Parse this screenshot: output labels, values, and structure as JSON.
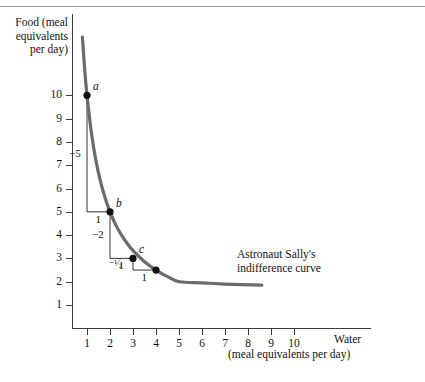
{
  "chart_data": {
    "type": "line",
    "title": "",
    "xlabel": "Water",
    "xlabel_unit": "(meal equivalents per day)",
    "ylabel_lines": [
      "Food (meal",
      "equivalents",
      "per day)"
    ],
    "xlim": [
      0,
      11.5
    ],
    "ylim": [
      0,
      13.2
    ],
    "grid": false,
    "legend": "none",
    "xticks": [
      1,
      2,
      3,
      4,
      5,
      6,
      7,
      8,
      9,
      10
    ],
    "yticks": [
      1,
      2,
      3,
      4,
      5,
      6,
      7,
      8,
      9,
      10
    ],
    "xtick_labels": [
      "1",
      "2",
      "3",
      "4",
      "5",
      "6",
      "7",
      "8",
      "9",
      "10"
    ],
    "ytick_labels": [
      "1",
      "2",
      "3",
      "4",
      "5",
      "6",
      "7",
      "8",
      "9",
      "10"
    ],
    "curve_name": "Astronaut Sally's indifference curve",
    "curve_note_lines": [
      "Astronaut Sally's",
      "indifference curve"
    ],
    "curve_color": "#6b6b6b",
    "curve_relation": "x*y = 10",
    "curve_x_range": [
      0.8,
      8.6
    ],
    "curve_points": [
      {
        "x": 0.8,
        "y": 12.5
      },
      {
        "x": 0.9,
        "y": 11.11
      },
      {
        "x": 1.0,
        "y": 10.0
      },
      {
        "x": 1.2,
        "y": 8.33
      },
      {
        "x": 1.4,
        "y": 7.14
      },
      {
        "x": 1.6,
        "y": 6.25
      },
      {
        "x": 1.8,
        "y": 5.56
      },
      {
        "x": 2.0,
        "y": 5.0
      },
      {
        "x": 2.25,
        "y": 4.44
      },
      {
        "x": 2.5,
        "y": 4.0
      },
      {
        "x": 2.75,
        "y": 3.64
      },
      {
        "x": 3.0,
        "y": 3.33
      },
      {
        "x": 3.5,
        "y": 2.86
      },
      {
        "x": 4.0,
        "y": 2.5
      },
      {
        "x": 4.5,
        "y": 2.22
      },
      {
        "x": 5.0,
        "y": 2.0
      },
      {
        "x": 6.0,
        "y": 1.95
      },
      {
        "x": 7.0,
        "y": 1.9
      },
      {
        "x": 8.6,
        "y": 1.85
      }
    ],
    "marked_points": [
      {
        "label": "a",
        "x": 1,
        "y": 10
      },
      {
        "label": "b",
        "x": 2,
        "y": 5
      },
      {
        "label": "c",
        "x": 3,
        "y": 3
      },
      {
        "label": "",
        "x": 4,
        "y": 2.5
      }
    ],
    "step_annotations": [
      {
        "from": "a",
        "to": "b",
        "rise": "−5",
        "run": "1"
      },
      {
        "from": "b",
        "to": "c",
        "rise": "−2",
        "run": "1"
      },
      {
        "from": "c",
        "to": "d",
        "rise": "−¹⁄₂",
        "run": "1"
      }
    ]
  },
  "caption": ""
}
